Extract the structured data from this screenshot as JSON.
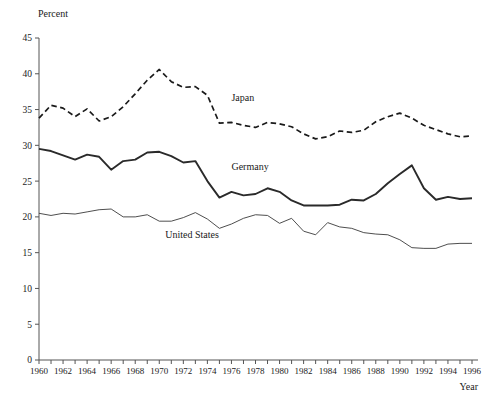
{
  "chart_data": {
    "type": "line",
    "title": "",
    "subtitle": "",
    "xlabel": "Year",
    "ylabel": "Percent",
    "xlim": [
      1960,
      1996
    ],
    "ylim": [
      0,
      45
    ],
    "y_ticks": [
      0,
      5,
      10,
      15,
      20,
      25,
      30,
      35,
      40,
      45
    ],
    "x_ticks": [
      1960,
      1961,
      1962,
      1963,
      1964,
      1965,
      1966,
      1967,
      1968,
      1969,
      1970,
      1971,
      1972,
      1973,
      1974,
      1975,
      1976,
      1977,
      1978,
      1979,
      1980,
      1981,
      1982,
      1983,
      1984,
      1985,
      1986,
      1987,
      1988,
      1989,
      1990,
      1991,
      1992,
      1993,
      1994,
      1995,
      1996
    ],
    "x_tick_labels": [
      "1960",
      "1962",
      "1964",
      "1966",
      "1968",
      "1970",
      "1972",
      "1974",
      "1976",
      "1978",
      "1980",
      "1982",
      "1984",
      "1986",
      "1988",
      "1990",
      "1992",
      "1994",
      "1996"
    ],
    "x_tick_label_years": [
      1960,
      1962,
      1964,
      1966,
      1968,
      1970,
      1972,
      1974,
      1976,
      1978,
      1980,
      1982,
      1984,
      1986,
      1988,
      1990,
      1992,
      1994,
      1996
    ],
    "grid": false,
    "legend": "inline-annotations",
    "x": [
      1960,
      1961,
      1962,
      1963,
      1964,
      1965,
      1966,
      1967,
      1968,
      1969,
      1970,
      1971,
      1972,
      1973,
      1974,
      1975,
      1976,
      1977,
      1978,
      1979,
      1980,
      1981,
      1982,
      1983,
      1984,
      1985,
      1986,
      1987,
      1988,
      1989,
      1990,
      1991,
      1992,
      1993,
      1994,
      1995,
      1996
    ],
    "series": [
      {
        "name": "Japan",
        "style": "dashed",
        "color": "#1a1a1a",
        "label_x": 1976,
        "label_y": 36.2,
        "values": [
          33.8,
          35.6,
          35.2,
          34.0,
          35.1,
          33.4,
          34.0,
          35.4,
          37.2,
          39.1,
          40.6,
          38.9,
          38.1,
          38.2,
          37.0,
          33.1,
          33.2,
          32.8,
          32.5,
          33.2,
          33.0,
          32.6,
          31.6,
          30.9,
          31.2,
          32.0,
          31.8,
          32.1,
          33.3,
          34.0,
          34.5,
          33.8,
          32.8,
          32.2,
          31.6,
          31.2,
          31.3
        ]
      },
      {
        "name": "Germany",
        "style": "solid-thick",
        "color": "#2a2a2a",
        "label_x": 1976,
        "label_y": 26.6,
        "values": [
          29.5,
          29.2,
          28.6,
          28.0,
          28.7,
          28.4,
          26.6,
          27.8,
          28.0,
          29.0,
          29.1,
          28.5,
          27.6,
          27.8,
          25.0,
          22.7,
          23.5,
          23.0,
          23.2,
          24.0,
          23.5,
          22.3,
          21.6,
          21.6,
          21.6,
          21.7,
          22.4,
          22.3,
          23.2,
          24.7,
          26.0,
          27.2,
          24.0,
          22.4,
          22.8,
          22.5,
          22.6
        ]
      },
      {
        "name": "United States",
        "style": "solid-thin",
        "color": "#3a3a3a",
        "label_x": 1970.5,
        "label_y": 17.0,
        "values": [
          20.5,
          20.2,
          20.5,
          20.4,
          20.7,
          21.0,
          21.1,
          20.0,
          20.0,
          20.3,
          19.4,
          19.4,
          19.9,
          20.6,
          19.7,
          18.4,
          19.0,
          19.8,
          20.3,
          20.2,
          19.1,
          19.8,
          18.0,
          17.5,
          19.2,
          18.6,
          18.4,
          17.8,
          17.6,
          17.5,
          16.8,
          15.7,
          15.6,
          15.6,
          16.2,
          16.3,
          16.3
        ]
      }
    ]
  },
  "axis": {
    "y_title": "Percent",
    "x_title": "Year"
  }
}
